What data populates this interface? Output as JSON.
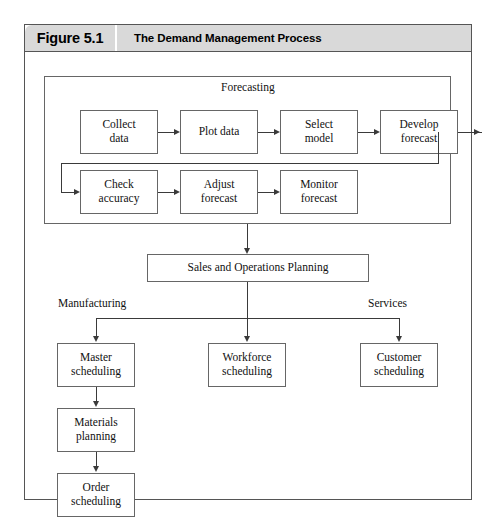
{
  "figure": {
    "number": "Figure 5.1",
    "title": "The Demand Management Process"
  },
  "groups": {
    "forecasting_label": "Forecasting"
  },
  "branch_labels": {
    "left": "Manufacturing",
    "right": "Services"
  },
  "nodes": {
    "collect_data": "Collect\ndata",
    "plot_data": "Plot data",
    "select_model": "Select\nmodel",
    "develop_forecast": "Develop\nforecast",
    "check_accuracy": "Check\naccuracy",
    "adjust_forecast": "Adjust\nforecast",
    "monitor_forecast": "Monitor\nforecast",
    "sales_ops_planning": "Sales and Operations Planning",
    "master_scheduling": "Master\nscheduling",
    "materials_planning": "Materials\nplanning",
    "order_scheduling": "Order\nscheduling",
    "workforce_scheduling": "Workforce\nscheduling",
    "customer_scheduling": "Customer\nscheduling"
  },
  "colors": {
    "frame_border": "#555555",
    "header_background": "#d9d9d9",
    "node_border": "#666666",
    "connector": "#3a3a3a",
    "text": "#111111"
  }
}
